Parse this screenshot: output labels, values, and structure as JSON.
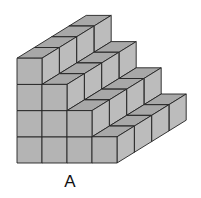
{
  "figure": {
    "label": "A",
    "columns": 4,
    "depth": 4,
    "column_heights": [
      4,
      3,
      2,
      1
    ],
    "colors": {
      "front": "#b4b4b4",
      "top": "#a8a8a8",
      "side": "#bcbcbc",
      "edge": "#222222"
    }
  }
}
